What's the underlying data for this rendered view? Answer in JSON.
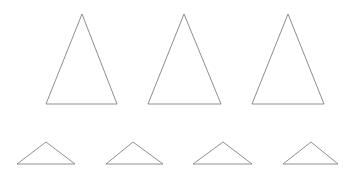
{
  "style": {
    "background": "#ffffff",
    "stroke": "#8f8f8f",
    "stroke_width": 1
  },
  "rows": [
    {
      "name": "tall-triangles",
      "triangles": [
        {
          "apex": [
            82,
            14
          ],
          "left": [
            46,
            104
          ],
          "right": [
            117,
            104
          ]
        },
        {
          "apex": [
            184,
            14
          ],
          "left": [
            148,
            104
          ],
          "right": [
            221,
            104
          ]
        },
        {
          "apex": [
            288,
            14
          ],
          "left": [
            252,
            104
          ],
          "right": [
            324,
            104
          ]
        }
      ]
    },
    {
      "name": "flat-triangles",
      "triangles": [
        {
          "apex": [
            46,
            142
          ],
          "left": [
            17,
            164
          ],
          "right": [
            75,
            164
          ]
        },
        {
          "apex": [
            133,
            142
          ],
          "left": [
            106,
            164
          ],
          "right": [
            163,
            164
          ]
        },
        {
          "apex": [
            223,
            142
          ],
          "left": [
            193,
            164
          ],
          "right": [
            252,
            164
          ]
        },
        {
          "apex": [
            311,
            142
          ],
          "left": [
            283,
            164
          ],
          "right": [
            338,
            164
          ]
        }
      ]
    }
  ]
}
